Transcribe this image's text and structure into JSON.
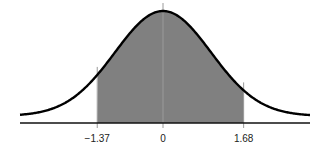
{
  "chart_data": {
    "type": "area",
    "title": "",
    "subtitle": "",
    "xlabel": "",
    "ylabel": "",
    "distribution": "standard normal",
    "mean": 0,
    "std": 1,
    "shaded_region": {
      "from": -1.37,
      "to": 1.68
    },
    "tick_labels": [
      "−1.37",
      "0",
      "1.68"
    ],
    "tick_values": [
      -1.37,
      0,
      1.68
    ],
    "xlim": [
      -3,
      3
    ],
    "grid": false,
    "legend": null,
    "colors": {
      "curve": "#000000",
      "shade": "#808080",
      "axis": "#111111",
      "marker_lines": "#9a9a9a"
    }
  }
}
